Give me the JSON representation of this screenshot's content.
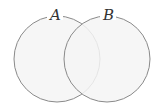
{
  "diagram": {
    "type": "venn",
    "sets": [
      {
        "label": "A",
        "cx": 57,
        "cy": 59,
        "r": 43
      },
      {
        "label": "B",
        "cx": 107,
        "cy": 59,
        "r": 43
      }
    ],
    "fill_color": "#f4f4f4",
    "stroke_color": "#8a8a8a",
    "background": "#ffffff"
  }
}
